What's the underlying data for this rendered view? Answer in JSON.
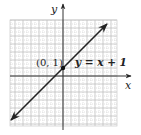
{
  "chart_data": {
    "type": "line",
    "title": "",
    "xlabel": "x",
    "ylabel": "y",
    "xlim": [
      -7,
      7
    ],
    "ylim": [
      -6,
      7
    ],
    "grid": true,
    "series": [
      {
        "name": "y = x + 1",
        "equation": "y = x + 1",
        "x": [
          -6.5,
          5.5
        ],
        "y": [
          -5.5,
          6.5
        ],
        "arrows": "both"
      }
    ],
    "annotations": [
      {
        "text": "(0, 1)",
        "x": 0,
        "y": 1,
        "marker": "point"
      },
      {
        "text": "y = x + 1",
        "x": 1.5,
        "y": 1.5
      }
    ]
  },
  "labels": {
    "x_axis": "x",
    "y_axis": "y",
    "point": "(0, 1)",
    "equation": "y = x + 1"
  },
  "colors": {
    "line": "#222222",
    "axis": "#333333",
    "grid": "#b0b0b0"
  }
}
